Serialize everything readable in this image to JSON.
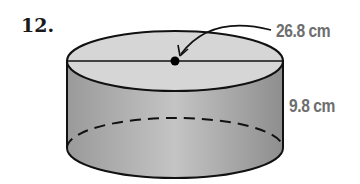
{
  "problem": {
    "number": "12."
  },
  "figure": {
    "shape": "cylinder",
    "diameter_label": "26.8 cm",
    "height_label": "9.8 cm",
    "colors": {
      "outline": "#111111",
      "side_fill": "#a9a9a9",
      "top_fill": "#d6d6d6",
      "label": "#6e6e6e"
    }
  }
}
